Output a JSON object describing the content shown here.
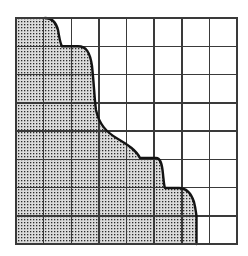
{
  "figure": {
    "kind": "grid-with-shaded-staircase-region",
    "canvas": {
      "width": 248,
      "height": 256
    },
    "background_color": "#ffffff"
  },
  "grid": {
    "columns": 8,
    "rows": 8,
    "x_left": 16,
    "x_right": 237,
    "y_top": 18,
    "y_bottom": 244,
    "cell_width": 27.625,
    "cell_height": 28.25,
    "line_color": "#3a3a3a",
    "inner_line_width": 1.6,
    "border_line_width": 2.2,
    "vertical_line_x": [
      16,
      43.6,
      71.3,
      98.9,
      126.5,
      154.1,
      181.8,
      209.4,
      237
    ],
    "horizontal_line_y": [
      18,
      46.3,
      74.5,
      102.8,
      131,
      159.3,
      187.5,
      215.8,
      244
    ]
  },
  "shaded_region": {
    "fill_color": "#d6d6d6",
    "fill_pattern": "fine-dotted-stipple",
    "dot_color": "#2b2b2b",
    "outline_color": "#141414",
    "outline_width": 2.4,
    "boundary_curve_label": "decreasing-step-curve",
    "steps": [
      {
        "step": 1,
        "top_y": 18,
        "flat_x_end": 47,
        "drop_to_y": 46.3,
        "x_at_drop": 60
      },
      {
        "step": 2,
        "top_y": 46.3,
        "flat_x_end": 80,
        "drop_to_y": 110,
        "x_at_drop": 95
      },
      {
        "step": 3,
        "top_y": 110,
        "flat_x_end": 120,
        "drop_to_y": 159.3,
        "x_at_drop": 141
      },
      {
        "step": 4,
        "top_y": 159.3,
        "flat_x_end": 156,
        "drop_to_y": 187.5,
        "x_at_drop": 163
      },
      {
        "step": 5,
        "top_y": 187.5,
        "flat_x_end": 178,
        "drop_to_y": 215.8,
        "x_at_drop": 196
      },
      {
        "step": 6,
        "top_y": 215.8,
        "flat_x_end": 196,
        "drop_to_y": 244,
        "x_at_drop": 196
      }
    ]
  }
}
